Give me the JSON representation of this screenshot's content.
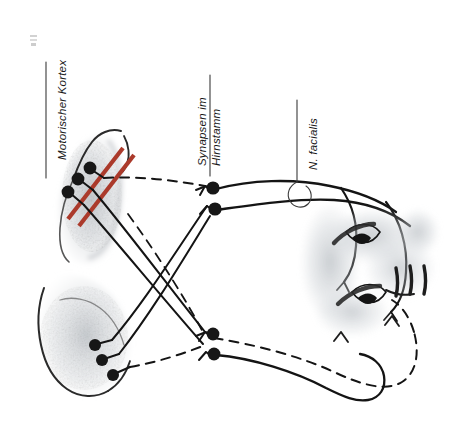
{
  "figure": {
    "type": "anatomical-diagram",
    "language": "de",
    "orientation_note": "Illustration rendered rotated 90 degrees; labels read bottom-to-top",
    "background_color": "#ffffff",
    "ink_color": "#141414",
    "accent_color": "#ab3a2b",
    "tissue_tint": "#b9bfc4"
  },
  "labels": {
    "motor_cortex": {
      "text": "Motorischer Kortex",
      "leader": "straight-line"
    },
    "brainstem_synapses": {
      "line1": "Synapsen im",
      "line2": "Hirnstamm",
      "leader": "straight-line"
    },
    "facial_nerve": {
      "text": "N. facialis",
      "leader": "line-with-loop"
    }
  },
  "structures": {
    "cortex_upper": {
      "name": "motor-cortex-upper-hemisphere",
      "neuron_count": 3,
      "accent_bars": 2,
      "accent_color": "#ab3a2b"
    },
    "cortex_lower": {
      "name": "motor-cortex-lower-hemisphere",
      "neuron_count": 3,
      "accent_bars": 0
    },
    "brainstem_upper": {
      "name": "brainstem-nucleus-upper",
      "synapse_count": 2
    },
    "brainstem_lower": {
      "name": "brainstem-nucleus-lower",
      "synapse_count": 2
    },
    "face": {
      "name": "face-profile",
      "eyes": 2,
      "eyebrows": 2,
      "mouth_creases": 3
    }
  },
  "pathways": {
    "solid": {
      "style": "solid",
      "meaning": "ipsilateral / direct corticobulbar fibres"
    },
    "dashed": {
      "style": "dashed",
      "meaning": "crossed / contralateral corticobulbar fibres"
    }
  }
}
